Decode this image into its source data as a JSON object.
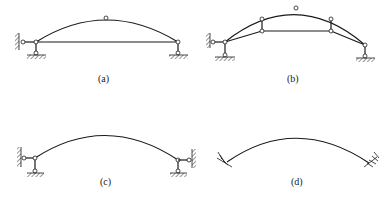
{
  "figure": {
    "panels": [
      {
        "id": "a",
        "caption": "(a)",
        "type": "three-hinged tied arch"
      },
      {
        "id": "b",
        "caption": "(b)",
        "type": "three-hinged trussed arch"
      },
      {
        "id": "c",
        "caption": "(c)",
        "type": "two-hinged arch"
      },
      {
        "id": "d",
        "caption": "(d)",
        "type": "fixed (hingeless) arch"
      }
    ]
  },
  "colors": {
    "ink": "#1a1a1a",
    "background": "#ffffff"
  }
}
